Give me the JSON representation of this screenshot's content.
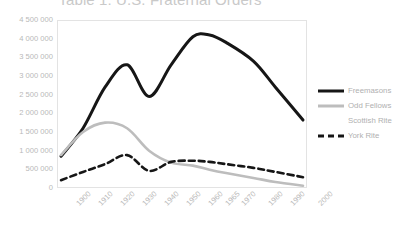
{
  "chart": {
    "title": "Table 1: U.S. Fraternal Orders",
    "type_label": "line-chart"
  },
  "legend": {
    "position": "right",
    "items": [
      {
        "label": "Freemasons",
        "style": "solid-thick",
        "color": "#161616"
      },
      {
        "label": "Odd Fellows",
        "style": "solid-gray",
        "color": "#bdbdbd"
      },
      {
        "label": "Scottish Rite",
        "style": "none",
        "color": "#ffffff"
      },
      {
        "label": "York Rite",
        "style": "dashed",
        "color": "#161616"
      }
    ]
  },
  "chart_data": {
    "type": "line",
    "title": "Table 1: U.S. Fraternal Orders",
    "xlabel": "",
    "ylabel": "",
    "grid": false,
    "legend_position": "right",
    "categories": [
      "1900",
      "1910",
      "1920",
      "1930",
      "1940",
      "1950",
      "1960",
      "1965",
      "1970",
      "1980",
      "1990",
      "2000"
    ],
    "ylim": [
      0,
      4500000
    ],
    "ytick_labels": [
      "4 500 000",
      "4 000 000",
      "3 500 000",
      "3 000 000",
      "2 500 000",
      "2 000 000",
      "1 500 000",
      "1 000 000",
      "500 000",
      "0"
    ],
    "ytick_values": [
      4500000,
      4000000,
      3500000,
      3000000,
      2500000,
      2000000,
      1500000,
      1000000,
      500000,
      0
    ],
    "series": [
      {
        "name": "Freemasons",
        "color": "#161616",
        "style": "solid",
        "width": 3,
        "values": [
          850000,
          1600000,
          2700000,
          3300000,
          2450000,
          3300000,
          4050000,
          4100000,
          3900000,
          3400000,
          2700000,
          1820000
        ]
      },
      {
        "name": "Odd Fellows",
        "color": "#bdbdbd",
        "style": "solid",
        "width": 2.6,
        "values": [
          880000,
          1500000,
          1750000,
          1600000,
          1000000,
          680000,
          600000,
          490000,
          400000,
          270000,
          160000,
          60000
        ]
      },
      {
        "name": "Scottish Rite",
        "color": "#ffffff",
        "style": "solid",
        "width": 2.6,
        "values": [
          null,
          null,
          null,
          null,
          null,
          null,
          null,
          null,
          null,
          null,
          null,
          null
        ]
      },
      {
        "name": "York Rite",
        "color": "#161616",
        "style": "dashed",
        "width": 2.6,
        "values": [
          210000,
          430000,
          640000,
          880000,
          460000,
          700000,
          730000,
          700000,
          640000,
          540000,
          430000,
          290000
        ]
      }
    ]
  }
}
